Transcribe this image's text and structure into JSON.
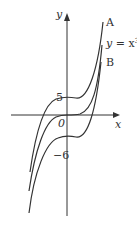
{
  "diagram": {
    "axes": {
      "x_label": "x",
      "y_label": "y",
      "origin_label": "0"
    },
    "y_intercept_labels": {
      "upper": "5",
      "lower": "−6"
    },
    "curves": [
      {
        "id": "A",
        "label": "A",
        "equation": "y = x³ + 5"
      },
      {
        "id": "middle",
        "label": "y = x³",
        "equation": "y = x³"
      },
      {
        "id": "B",
        "label": "B",
        "equation": "y = x³ − 6"
      }
    ],
    "middle_label_parts": {
      "prefix": "y",
      "eq": " = x",
      "exp": "3"
    },
    "colors": {
      "line": "#333333",
      "background": "#ffffff"
    }
  }
}
